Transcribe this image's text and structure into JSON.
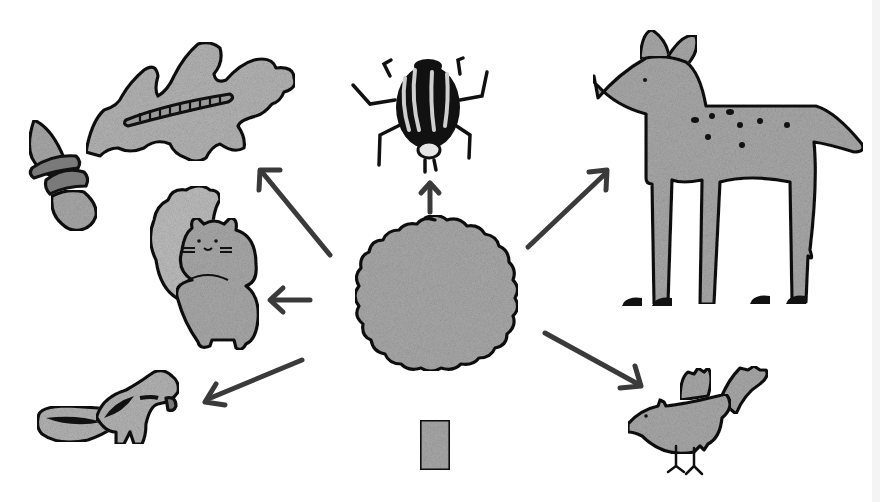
{
  "diagram": {
    "type": "food-web",
    "background": "#ffffff",
    "colors": {
      "fill_gray": "#a9a9a9",
      "fill_light": "#c4c4c4",
      "ink": "#111111",
      "arrow": "#3a3a3a",
      "edge_strip": "#f4f4f4"
    },
    "center": {
      "name": "oak-tree",
      "position": [
        420,
        330
      ]
    },
    "nodes": [
      {
        "id": "oak-leaf-caterpillar-acorns",
        "position": [
          160,
          120
        ]
      },
      {
        "id": "beetle",
        "position": [
          420,
          90
        ]
      },
      {
        "id": "deer",
        "position": [
          730,
          170
        ]
      },
      {
        "id": "squirrel",
        "position": [
          200,
          275
        ]
      },
      {
        "id": "chipmunk",
        "position": [
          105,
          410
        ]
      },
      {
        "id": "bird",
        "position": [
          690,
          415
        ]
      }
    ],
    "arrows": [
      {
        "from": "oak-tree",
        "to": "oak-leaf-caterpillar-acorns",
        "start": [
          330,
          255
        ],
        "end": [
          260,
          170
        ]
      },
      {
        "from": "oak-tree",
        "to": "beetle",
        "start": [
          430,
          212
        ],
        "end": [
          430,
          183
        ]
      },
      {
        "from": "oak-tree",
        "to": "deer",
        "start": [
          528,
          247
        ],
        "end": [
          607,
          172
        ]
      },
      {
        "from": "oak-tree",
        "to": "squirrel",
        "start": [
          310,
          300
        ],
        "end": [
          270,
          300
        ]
      },
      {
        "from": "oak-tree",
        "to": "chipmunk",
        "start": [
          302,
          360
        ],
        "end": [
          205,
          400
        ]
      },
      {
        "from": "oak-tree",
        "to": "bird",
        "start": [
          545,
          333
        ],
        "end": [
          640,
          385
        ]
      }
    ]
  }
}
